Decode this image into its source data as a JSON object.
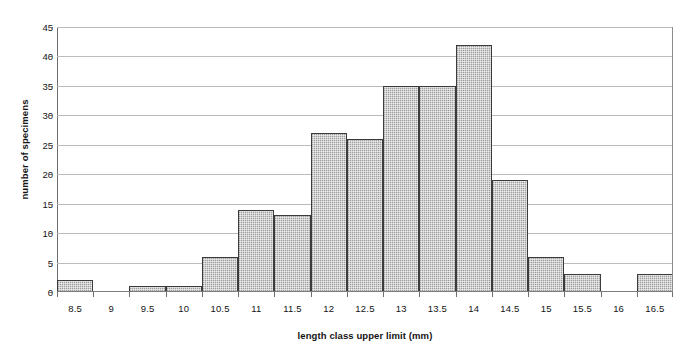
{
  "chart_data": {
    "type": "bar",
    "title": "",
    "subtitle": "",
    "xlabel": "length class upper limit (mm)",
    "ylabel": "number of specimens",
    "categories": [
      "8.5",
      "9",
      "9.5",
      "10",
      "10.5",
      "11",
      "11.5",
      "12",
      "12.5",
      "13",
      "13.5",
      "14",
      "14.5",
      "15",
      "15.5",
      "16",
      "16.5"
    ],
    "values": [
      2,
      0,
      1,
      1,
      6,
      14,
      13,
      27,
      26,
      35,
      35,
      42,
      19,
      6,
      3,
      0,
      3
    ],
    "ylim": [
      0,
      45
    ],
    "ytick_labels": [
      "0",
      "5",
      "10",
      "15",
      "20",
      "25",
      "30",
      "35",
      "40",
      "45"
    ],
    "ytick_values": [
      0,
      5,
      10,
      15,
      20,
      25,
      30,
      35,
      40,
      45
    ],
    "grid": "horizontal",
    "legend": "none",
    "bar_fill_color": "#bdbdbd",
    "bar_border_color": "#3b3b3b",
    "gridline_color": "#bcbcbc",
    "axis_color": "#6e6e6e",
    "text_color": "#141414",
    "background_color": "#ffffff"
  }
}
